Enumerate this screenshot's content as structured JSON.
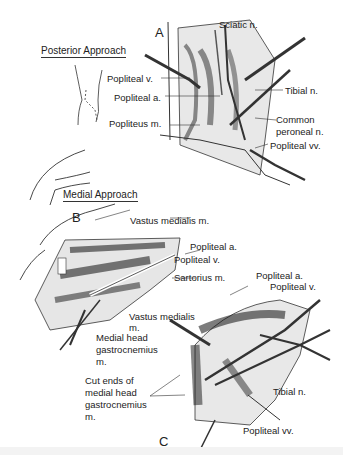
{
  "figure": {
    "panels": {
      "a": {
        "letter": "A",
        "title": "Posterior Approach",
        "labels": [
          "Sciatic n.",
          "Popliteal v.",
          "Popliteal a.",
          "Tibial n.",
          "Popliteus m.",
          "Common",
          "peroneal n.",
          "Popliteal vv."
        ]
      },
      "b": {
        "letter": "B",
        "title": "Medial Approach",
        "labels": [
          "Vastus medialis m.",
          "Popliteal a.",
          "Popliteal v.",
          "Sartorius m.",
          "Medial head",
          "gastrocnemius",
          "m."
        ]
      },
      "c": {
        "letter": "C",
        "labels": [
          "Popliteal a.",
          "Popliteal v.",
          "Vastus medialis",
          "m.",
          "Cut ends of",
          "medial head",
          "gastrocnemius",
          "m.",
          "Tibial n.",
          "Popliteal vv."
        ]
      }
    }
  }
}
